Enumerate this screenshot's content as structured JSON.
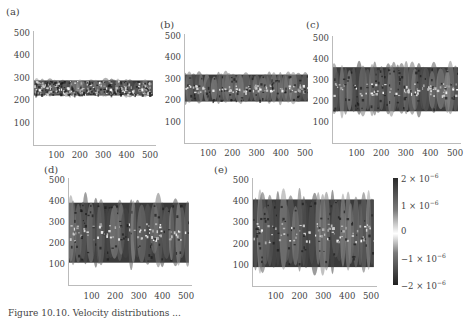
{
  "figure": {
    "caption_partial": "Figure 10.10. Velocity distributions ..."
  },
  "colorbar": {
    "labels": [
      {
        "mant": "2 × 10",
        "exp": "−6",
        "value": 2e-06
      },
      {
        "mant": "1 × 10",
        "exp": "−6",
        "value": 1e-06
      },
      {
        "mant": "0",
        "exp": "",
        "value": 0
      },
      {
        "mant": "−1 × 10",
        "exp": "−6",
        "value": -1e-06
      },
      {
        "mant": "−2 × 10",
        "exp": "−6",
        "value": -2e-06
      }
    ]
  },
  "chart_data": [
    {
      "type": "heatmap",
      "panel": "(a)",
      "xlabel": "",
      "ylabel": "",
      "xlim": [
        0,
        512
      ],
      "ylim": [
        0,
        500
      ],
      "xticks": [
        100,
        200,
        300,
        400,
        500
      ],
      "yticks": [
        100,
        200,
        300,
        400,
        500
      ],
      "band": {
        "ymin": 215,
        "ymax": 295,
        "center": 255
      }
    },
    {
      "type": "heatmap",
      "panel": "(b)",
      "xlabel": "",
      "ylabel": "",
      "xlim": [
        0,
        512
      ],
      "ylim": [
        0,
        500
      ],
      "xticks": [
        100,
        200,
        300,
        400,
        500
      ],
      "yticks": [
        100,
        200,
        300,
        400,
        500
      ],
      "band": {
        "ymin": 180,
        "ymax": 330,
        "center": 255
      }
    },
    {
      "type": "heatmap",
      "panel": "(c)",
      "xlabel": "",
      "ylabel": "",
      "xlim": [
        0,
        512
      ],
      "ylim": [
        0,
        500
      ],
      "xticks": [
        100,
        200,
        300,
        400,
        500
      ],
      "yticks": [
        100,
        200,
        300,
        400,
        500
      ],
      "band": {
        "ymin": 130,
        "ymax": 380,
        "center": 255
      }
    },
    {
      "type": "heatmap",
      "panel": "(d)",
      "xlabel": "",
      "ylabel": "",
      "xlim": [
        0,
        512
      ],
      "ylim": [
        0,
        500
      ],
      "xticks": [
        100,
        200,
        300,
        400,
        500
      ],
      "yticks": [
        100,
        200,
        300,
        400,
        500
      ],
      "band": {
        "ymin": 80,
        "ymax": 420,
        "center": 255
      }
    },
    {
      "type": "heatmap",
      "panel": "(e)",
      "xlabel": "",
      "ylabel": "",
      "xlim": [
        0,
        512
      ],
      "ylim": [
        0,
        500
      ],
      "xticks": [
        100,
        200,
        300,
        400,
        500
      ],
      "yticks": [
        100,
        200,
        300,
        400,
        500
      ],
      "band": {
        "ymin": 60,
        "ymax": 440,
        "center": 255
      }
    },
    {
      "type": "colorbar",
      "range": [
        -2e-06,
        2e-06
      ],
      "ticks": [
        -2e-06,
        -1e-06,
        0,
        1e-06,
        2e-06
      ],
      "colormap": "grayscale, white at 0, dark at extremes"
    }
  ],
  "panels": [
    {
      "label": "(a)",
      "x": 33,
      "y0": 145,
      "y500": 33,
      "xAxisY": 145,
      "x0": 33,
      "x500": 150,
      "lblX": 6,
      "lblY": 6,
      "tickY": 150
    },
    {
      "label": "(b)",
      "x": 184,
      "y0": 143,
      "y500": 36,
      "xAxisY": 143,
      "x0": 184,
      "x500": 305,
      "lblX": 160,
      "lblY": 19,
      "tickY": 148
    },
    {
      "label": "(c)",
      "x": 332,
      "y0": 143,
      "y500": 38,
      "xAxisY": 143,
      "x0": 332,
      "x500": 455,
      "lblX": 306,
      "lblY": 19,
      "tickY": 148
    },
    {
      "label": "(d)",
      "x": 68,
      "y0": 285,
      "y500": 180,
      "xAxisY": 285,
      "x0": 68,
      "x500": 186,
      "lblX": 44,
      "lblY": 164,
      "tickY": 291
    },
    {
      "label": "(e)",
      "x": 252,
      "y0": 286,
      "y500": 180,
      "xAxisY": 286,
      "x0": 252,
      "x500": 371,
      "lblX": 214,
      "lblY": 164,
      "tickY": 291
    }
  ]
}
